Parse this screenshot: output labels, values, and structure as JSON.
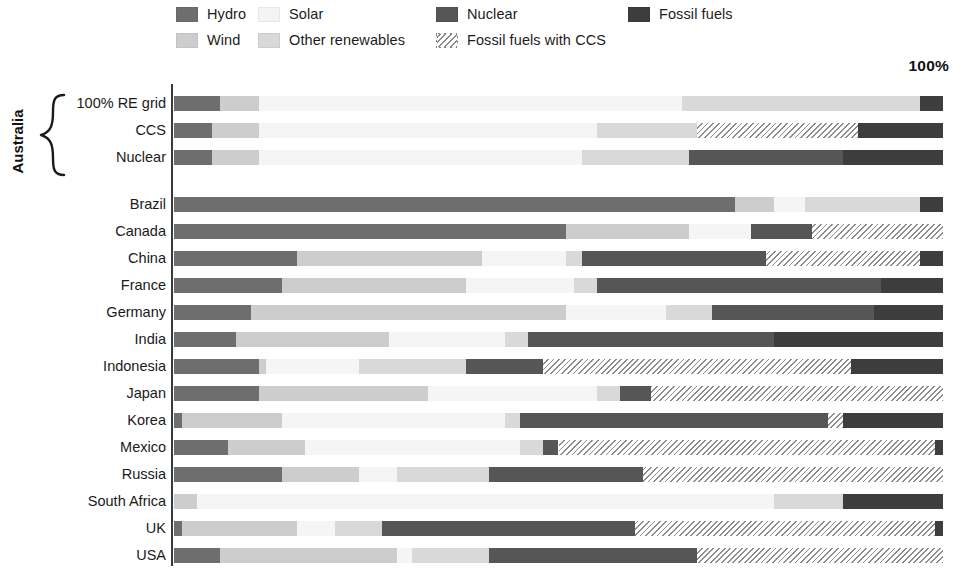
{
  "legend": {
    "items": [
      {
        "label": "Hydro",
        "key": "hydro",
        "color": "#6e6e6e",
        "swatch": "hydro-swatch",
        "col": 0,
        "row": 0
      },
      {
        "label": "Wind",
        "key": "wind",
        "color": "#cdcdcd",
        "swatch": "wind-swatch",
        "col": 0,
        "row": 1
      },
      {
        "label": "Solar",
        "key": "solar",
        "color": "#f4f4f4",
        "swatch": "solar-swatch",
        "col": 1,
        "row": 0
      },
      {
        "label": "Other renewables",
        "key": "other",
        "color": "#d9d9d9",
        "swatch": "other-swatch",
        "col": 1,
        "row": 1
      },
      {
        "label": "Nuclear",
        "key": "nuclear",
        "color": "#565656",
        "swatch": "nuclear-swatch",
        "col": 2,
        "row": 0
      },
      {
        "label": "Fossil fuels with CCS",
        "key": "ccs",
        "color": "#8c8c8c",
        "swatch": "ccs-swatch",
        "col": 2,
        "row": 1
      },
      {
        "label": "Fossil fuels",
        "key": "fossil",
        "color": "#3d3d3d",
        "swatch": "fossil-swatch",
        "col": 3,
        "row": 0
      }
    ]
  },
  "axis": {
    "top_right_label": "100%"
  },
  "group": {
    "australia_label": "Australia"
  },
  "chart_data": {
    "type": "bar",
    "orientation": "horizontal",
    "stacked": true,
    "normalized": true,
    "title": "",
    "xlabel": "",
    "ylabel": "",
    "xlim": [
      0,
      100
    ],
    "xunit": "%",
    "grid": false,
    "legend_position": "top",
    "series": [
      {
        "name": "Hydro",
        "key": "hydro",
        "color": "#6e6e6e"
      },
      {
        "name": "Wind",
        "key": "wind",
        "color": "#cdcdcd"
      },
      {
        "name": "Solar",
        "key": "solar",
        "color": "#f4f4f4"
      },
      {
        "name": "Other renewables",
        "key": "other",
        "color": "#d9d9d9"
      },
      {
        "name": "Nuclear",
        "key": "nuclear",
        "color": "#565656"
      },
      {
        "name": "Fossil fuels with CCS",
        "key": "ccs",
        "color": "#8c8c8c"
      },
      {
        "name": "Fossil fuels",
        "key": "fossil",
        "color": "#3d3d3d"
      }
    ],
    "groups": [
      {
        "name": "Australia",
        "rows": [
          {
            "label": "100% RE grid",
            "segments": [
              {
                "key": "hydro",
                "value": 6
              },
              {
                "key": "wind",
                "value": 5
              },
              {
                "key": "solar",
                "value": 55
              },
              {
                "key": "other",
                "value": 31
              },
              {
                "key": "fossil",
                "value": 3
              }
            ]
          },
          {
            "label": "CCS",
            "segments": [
              {
                "key": "hydro",
                "value": 5
              },
              {
                "key": "wind",
                "value": 6
              },
              {
                "key": "solar",
                "value": 44
              },
              {
                "key": "other",
                "value": 13
              },
              {
                "key": "ccs",
                "value": 21
              },
              {
                "key": "fossil",
                "value": 11
              }
            ]
          },
          {
            "label": "Nuclear",
            "segments": [
              {
                "key": "hydro",
                "value": 5
              },
              {
                "key": "wind",
                "value": 6
              },
              {
                "key": "solar",
                "value": 42
              },
              {
                "key": "other",
                "value": 14
              },
              {
                "key": "nuclear",
                "value": 20
              },
              {
                "key": "fossil",
                "value": 13
              }
            ]
          }
        ]
      },
      {
        "name": "Countries",
        "rows": [
          {
            "label": "Brazil",
            "segments": [
              {
                "key": "hydro",
                "value": 73
              },
              {
                "key": "wind",
                "value": 5
              },
              {
                "key": "solar",
                "value": 4
              },
              {
                "key": "other",
                "value": 15
              },
              {
                "key": "fossil",
                "value": 3
              }
            ]
          },
          {
            "label": "Canada",
            "segments": [
              {
                "key": "hydro",
                "value": 51
              },
              {
                "key": "wind",
                "value": 16
              },
              {
                "key": "solar",
                "value": 8
              },
              {
                "key": "nuclear",
                "value": 8
              },
              {
                "key": "ccs",
                "value": 17
              }
            ]
          },
          {
            "label": "China",
            "segments": [
              {
                "key": "hydro",
                "value": 16
              },
              {
                "key": "wind",
                "value": 24
              },
              {
                "key": "solar",
                "value": 11
              },
              {
                "key": "other",
                "value": 2
              },
              {
                "key": "nuclear",
                "value": 24
              },
              {
                "key": "ccs",
                "value": 20
              },
              {
                "key": "fossil",
                "value": 3
              }
            ]
          },
          {
            "label": "France",
            "segments": [
              {
                "key": "hydro",
                "value": 14
              },
              {
                "key": "wind",
                "value": 24
              },
              {
                "key": "solar",
                "value": 14
              },
              {
                "key": "other",
                "value": 3
              },
              {
                "key": "nuclear",
                "value": 37
              },
              {
                "key": "fossil",
                "value": 8
              }
            ]
          },
          {
            "label": "Germany",
            "segments": [
              {
                "key": "hydro",
                "value": 10
              },
              {
                "key": "wind",
                "value": 41
              },
              {
                "key": "solar",
                "value": 13
              },
              {
                "key": "other",
                "value": 6
              },
              {
                "key": "nuclear",
                "value": 21
              },
              {
                "key": "fossil",
                "value": 9
              }
            ]
          },
          {
            "label": "India",
            "segments": [
              {
                "key": "hydro",
                "value": 8
              },
              {
                "key": "wind",
                "value": 20
              },
              {
                "key": "solar",
                "value": 15
              },
              {
                "key": "other",
                "value": 3
              },
              {
                "key": "nuclear",
                "value": 32
              },
              {
                "key": "fossil",
                "value": 22
              }
            ]
          },
          {
            "label": "Indonesia",
            "segments": [
              {
                "key": "hydro",
                "value": 11
              },
              {
                "key": "wind",
                "value": 1
              },
              {
                "key": "solar",
                "value": 12
              },
              {
                "key": "other",
                "value": 14
              },
              {
                "key": "nuclear",
                "value": 10
              },
              {
                "key": "ccs",
                "value": 40
              },
              {
                "key": "fossil",
                "value": 12
              }
            ]
          },
          {
            "label": "Japan",
            "segments": [
              {
                "key": "hydro",
                "value": 11
              },
              {
                "key": "wind",
                "value": 22
              },
              {
                "key": "solar",
                "value": 22
              },
              {
                "key": "other",
                "value": 3
              },
              {
                "key": "nuclear",
                "value": 4
              },
              {
                "key": "ccs",
                "value": 38
              }
            ]
          },
          {
            "label": "Korea",
            "segments": [
              {
                "key": "hydro",
                "value": 1
              },
              {
                "key": "wind",
                "value": 13
              },
              {
                "key": "solar",
                "value": 29
              },
              {
                "key": "other",
                "value": 2
              },
              {
                "key": "nuclear",
                "value": 40
              },
              {
                "key": "ccs",
                "value": 2
              },
              {
                "key": "fossil",
                "value": 13
              }
            ]
          },
          {
            "label": "Mexico",
            "segments": [
              {
                "key": "hydro",
                "value": 7
              },
              {
                "key": "wind",
                "value": 10
              },
              {
                "key": "solar",
                "value": 28
              },
              {
                "key": "other",
                "value": 3
              },
              {
                "key": "nuclear",
                "value": 2
              },
              {
                "key": "ccs",
                "value": 49
              },
              {
                "key": "fossil",
                "value": 1
              }
            ]
          },
          {
            "label": "Russia",
            "segments": [
              {
                "key": "hydro",
                "value": 14
              },
              {
                "key": "wind",
                "value": 10
              },
              {
                "key": "solar",
                "value": 5
              },
              {
                "key": "other",
                "value": 12
              },
              {
                "key": "nuclear",
                "value": 20
              },
              {
                "key": "ccs",
                "value": 39
              }
            ]
          },
          {
            "label": "South Africa",
            "segments": [
              {
                "key": "wind",
                "value": 3
              },
              {
                "key": "solar",
                "value": 75
              },
              {
                "key": "other",
                "value": 9
              },
              {
                "key": "fossil",
                "value": 13
              }
            ]
          },
          {
            "label": "UK",
            "segments": [
              {
                "key": "hydro",
                "value": 1
              },
              {
                "key": "wind",
                "value": 15
              },
              {
                "key": "solar",
                "value": 5
              },
              {
                "key": "other",
                "value": 6
              },
              {
                "key": "nuclear",
                "value": 33
              },
              {
                "key": "ccs",
                "value": 39
              },
              {
                "key": "fossil",
                "value": 1
              }
            ]
          },
          {
            "label": "USA",
            "segments": [
              {
                "key": "hydro",
                "value": 6
              },
              {
                "key": "wind",
                "value": 23
              },
              {
                "key": "solar",
                "value": 2
              },
              {
                "key": "other",
                "value": 10
              },
              {
                "key": "nuclear",
                "value": 27
              },
              {
                "key": "ccs",
                "value": 32
              }
            ]
          }
        ]
      }
    ]
  }
}
